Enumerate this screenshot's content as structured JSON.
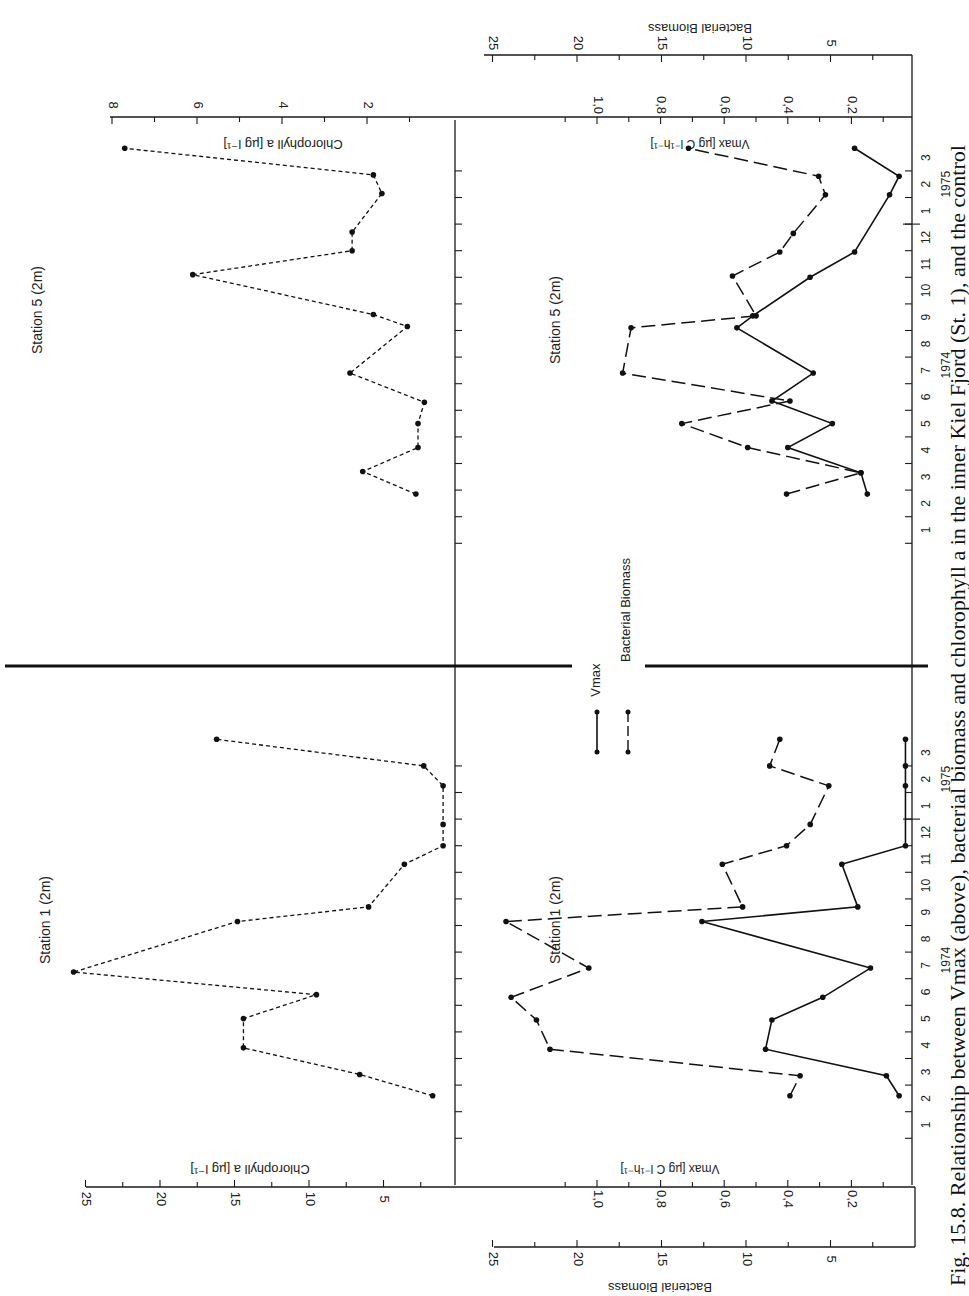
{
  "figure": {
    "caption": "Fig. 15.8. Relationship between V",
    "caption_sub": "max",
    "caption_rest": " (above), bacterial biomass and chlorophyll a in the inner Kiel Fjord (St. 1), and the control",
    "orientation": "rotated 90° counter-clockwise"
  },
  "legend": {
    "items": [
      {
        "label": "V",
        "sub": "max",
        "style": "solid"
      },
      {
        "label": "Bacterial  Biomass",
        "style": "dashed"
      }
    ]
  },
  "axes": {
    "months_1974": [
      "1",
      "2",
      "3",
      "4",
      "5",
      "6",
      "7",
      "8",
      "9",
      "10",
      "11",
      "12"
    ],
    "months_1975": [
      "1",
      "2",
      "3"
    ],
    "year_1974": "1974",
    "year_1975": "1975",
    "chl_label": "Chlorophyll a  [µg l⁻¹]",
    "vmax_label": "V",
    "vmax_label_sub": "max",
    "vmax_label_rest": "  [µg C l⁻¹h⁻¹]",
    "biomass_label": "Bacterial  Biomass",
    "st5_chl_ticks": [
      "8",
      "6",
      "4",
      "2"
    ],
    "st1_chl_ticks": [
      "25",
      "20",
      "15",
      "10",
      "5"
    ],
    "vmax_ticks": [
      "1,0",
      "0,8",
      "0,6",
      "0,4",
      "0,2"
    ],
    "biomass_ticks": [
      "25",
      "20",
      "15",
      "10",
      "5"
    ]
  },
  "chart_data": [
    {
      "type": "line",
      "title": "Station 5 (2m)",
      "xlabel": "Month (1974–1975)",
      "ylabel": "Chlorophyll a [µg l⁻¹]",
      "ylim": [
        0,
        8
      ],
      "x": [
        "Feb-74",
        "Mar-74",
        "Apr-74",
        "May-74",
        "Jun-74",
        "Jul-74",
        "Aug-74",
        "Sep-74",
        "Oct-74",
        "Nov-74",
        "Dec-74",
        "Jan-75",
        "Feb-75",
        "Mar-75"
      ],
      "x_pos": [
        2.35,
        3.2,
        4.1,
        5.0,
        5.8,
        6.9,
        8.65,
        9.1,
        10.6,
        11.5,
        12.2,
        13.65,
        14.35,
        15.35
      ],
      "series": [
        {
          "name": "Chlorophyll a",
          "style": "dotted",
          "values": [
            0.85,
            2.1,
            0.8,
            0.8,
            0.65,
            2.4,
            1.05,
            1.85,
            6.1,
            2.35,
            2.35,
            1.65,
            1.85,
            7.7
          ]
        }
      ]
    },
    {
      "type": "line",
      "title": "Station 5 (2m)",
      "xlabel": "Month (1974–1975)",
      "ylabel": "Vmax [µg C l⁻¹h⁻¹] / Bacterial Biomass",
      "ylim_vmax": [
        0,
        1.2
      ],
      "ylim_biomass": [
        0,
        25
      ],
      "x_pos_vmax": [
        2.35,
        3.15,
        4.1,
        5.0,
        5.85,
        6.9,
        8.6,
        9.05,
        10.5,
        11.45,
        13.6,
        14.3,
        15.35
      ],
      "x_pos_biomass": [
        2.35,
        3.15,
        4.1,
        5.0,
        5.85,
        6.9,
        8.6,
        9.05,
        10.55,
        11.45,
        12.15,
        13.6,
        14.3,
        15.35
      ],
      "series": [
        {
          "name": "Vmax",
          "style": "solid",
          "values": [
            0.15,
            0.17,
            0.4,
            0.26,
            0.45,
            0.32,
            0.56,
            0.51,
            0.33,
            0.19,
            0.08,
            0.05,
            0.19
          ]
        },
        {
          "name": "Bacterial Biomass",
          "style": "dashed",
          "values": [
            7.6,
            3.2,
            9.9,
            13.8,
            7.4,
            17.3,
            16.8,
            9.4,
            10.8,
            8.0,
            7.2,
            5.3,
            5.7,
            13.4
          ]
        }
      ]
    },
    {
      "type": "line",
      "title": "Station 1 (2m)",
      "xlabel": "Month (1974–1975)",
      "ylabel": "Chlorophyll a [µg l⁻¹]",
      "ylim": [
        0,
        26
      ],
      "x_pos": [
        2.1,
        2.9,
        3.9,
        5.0,
        5.9,
        6.75,
        8.65,
        9.2,
        10.8,
        11.5,
        12.3,
        13.75,
        14.5,
        15.5
      ],
      "series": [
        {
          "name": "Chlorophyll a",
          "style": "dotted",
          "values": [
            1.7,
            6.6,
            14.4,
            14.4,
            9.5,
            25.8,
            14.8,
            6.0,
            3.6,
            1.0,
            1.0,
            1.0,
            2.3,
            16.2
          ]
        }
      ]
    },
    {
      "type": "line",
      "title": "Station 1 (2m)",
      "xlabel": "Month (1974–1975)",
      "ylabel": "Vmax [µg C l⁻¹h⁻¹] / Bacterial Biomass",
      "ylim_vmax": [
        0,
        1.2
      ],
      "ylim_biomass": [
        0,
        25
      ],
      "x_pos": [
        2.1,
        2.85,
        3.85,
        4.95,
        5.8,
        6.9,
        8.65,
        9.2,
        10.8,
        11.5,
        12.3,
        13.75,
        14.5,
        15.5
      ],
      "series": [
        {
          "name": "Vmax",
          "style": "solid",
          "values": [
            0.05,
            0.09,
            0.47,
            0.45,
            0.29,
            0.14,
            0.67,
            0.18,
            0.23,
            0.03,
            null,
            0.03,
            0.03,
            0.03
          ]
        },
        {
          "name": "Bacterial Biomass",
          "style": "dashed",
          "values": [
            7.4,
            6.8,
            21.6,
            22.4,
            23.9,
            19.3,
            24.2,
            10.2,
            11.4,
            7.6,
            6.2,
            5.1,
            8.6,
            8.0
          ]
        }
      ]
    }
  ],
  "panels": {
    "st5_title": "Station  5  (2m)",
    "st5_title_lower": "Station  5  (2m)",
    "st1_title": "Station  1  (2m)",
    "st1_title_lower": "Station  1  (2m)"
  }
}
